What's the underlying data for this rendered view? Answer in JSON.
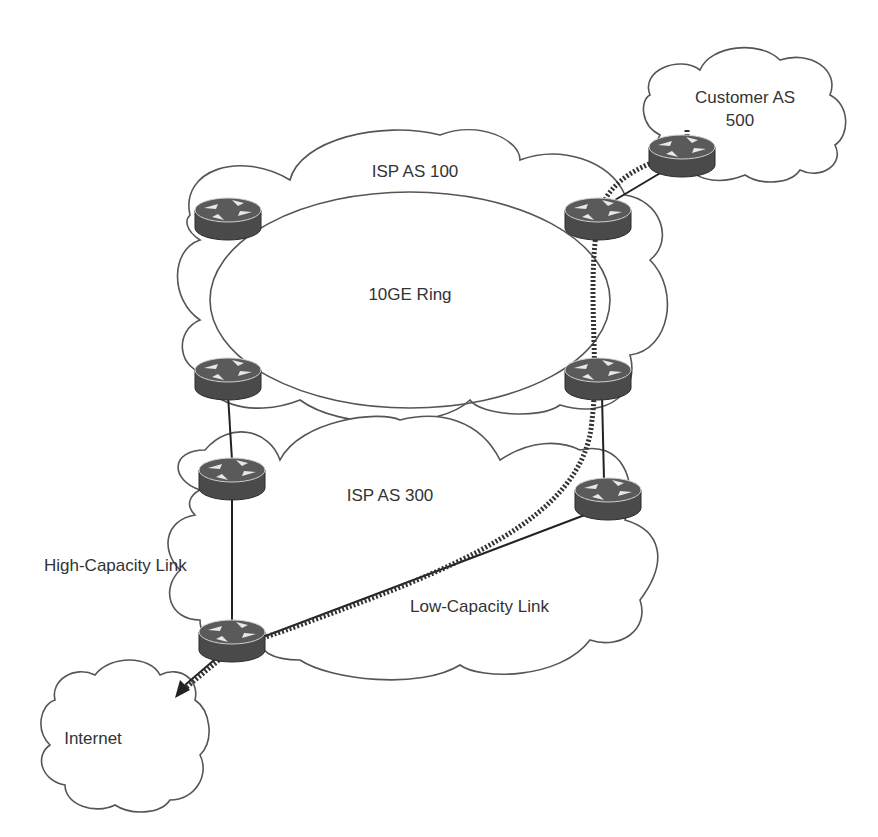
{
  "diagram": {
    "clouds": {
      "isp100": {
        "label": "ISP AS 100"
      },
      "ring": {
        "label": "10GE Ring"
      },
      "isp300": {
        "label": "ISP AS 300"
      },
      "customer": {
        "label_line1": "Customer AS",
        "label_line2": "500"
      },
      "internet": {
        "label": "Internet"
      }
    },
    "links": {
      "high_capacity": {
        "label": "High-Capacity Link"
      },
      "low_capacity": {
        "label": "Low-Capacity Link"
      }
    },
    "routers": [
      {
        "id": "r-isp100-top-left"
      },
      {
        "id": "r-isp100-top-right"
      },
      {
        "id": "r-isp100-bottom-left"
      },
      {
        "id": "r-isp100-bottom-right"
      },
      {
        "id": "r-isp300-top-left"
      },
      {
        "id": "r-isp300-right"
      },
      {
        "id": "r-isp300-bottom-left"
      },
      {
        "id": "r-customer"
      }
    ],
    "colors": {
      "router": "#4a4a4a",
      "stroke": "#555555",
      "text": "#333333"
    }
  }
}
